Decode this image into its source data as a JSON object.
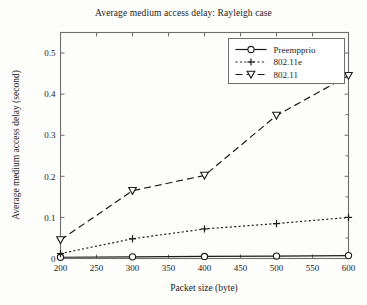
{
  "chart_data": {
    "type": "line",
    "title": "Average medium access delay: Rayleigh case",
    "xlabel": "Packet size (byte)",
    "ylabel": "Average medium access delay (second)",
    "x": [
      200,
      300,
      400,
      500,
      600
    ],
    "xlim": [
      200,
      600
    ],
    "ylim": [
      0,
      0.55
    ],
    "xticks": [
      200,
      250,
      300,
      350,
      400,
      450,
      500,
      550,
      600
    ],
    "xticklabels": [
      "200",
      "250",
      "300",
      "350",
      "400",
      "450",
      "500",
      "550",
      "600"
    ],
    "yticks": [
      0,
      0.1,
      0.2,
      0.3,
      0.4,
      0.5
    ],
    "yticklabels": [
      "0",
      "0.1",
      "0.2",
      "0.3",
      "0.4",
      "0.5"
    ],
    "grid": false,
    "legend_position": "upper right",
    "series": [
      {
        "name": "Preempprio",
        "values": [
          0.003,
          0.004,
          0.005,
          0.006,
          0.007
        ],
        "linestyle": "solid",
        "marker": "circle",
        "color": "#1b1b1b"
      },
      {
        "name": "802.11e",
        "values": [
          0.012,
          0.048,
          0.072,
          0.085,
          0.1
        ],
        "linestyle": "dotted",
        "marker": "plus",
        "color": "#1b1b1b"
      },
      {
        "name": "802.11",
        "values": [
          0.045,
          0.165,
          0.202,
          0.348,
          0.445
        ],
        "linestyle": "dashed",
        "marker": "triangle-down",
        "color": "#1b1b1b"
      }
    ]
  },
  "legend": {
    "items": [
      {
        "label": "Preempprio"
      },
      {
        "label": "802.11e"
      },
      {
        "label": "802.11"
      }
    ]
  }
}
